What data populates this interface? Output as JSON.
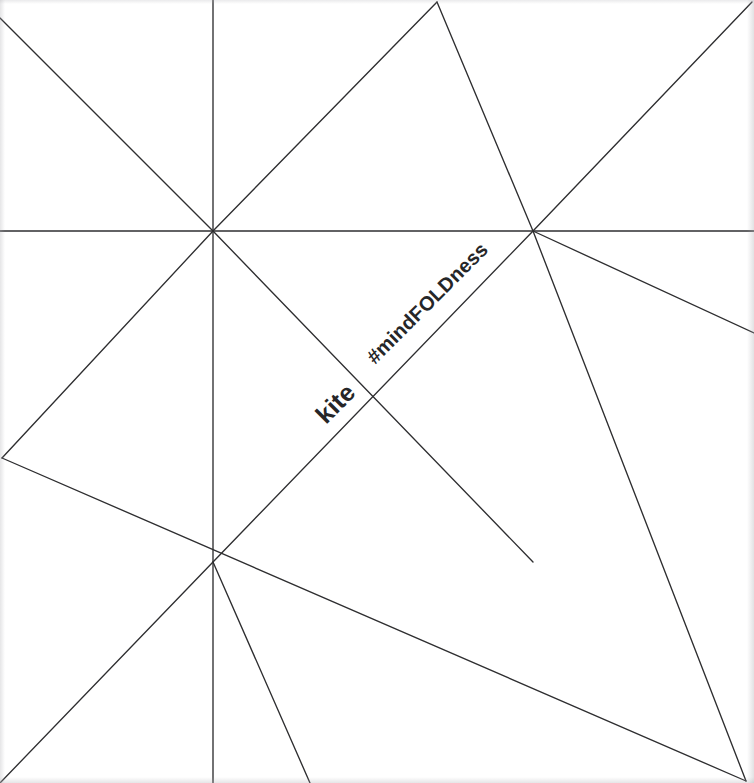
{
  "document": {
    "kind": "origami-crease-pattern",
    "model_name": "kite",
    "width": 754,
    "height": 783,
    "background_color": "#ffffff",
    "line_color": "#2e2e30",
    "text_color": "#262628"
  },
  "labels": {
    "model": "kite",
    "hashtag": "#mindFOLDness"
  },
  "chart_data": {
    "type": "diagram",
    "title": "kite",
    "annotations": [
      "kite",
      "#mindFOLDness"
    ],
    "vertices": [
      {
        "name": "center-star",
        "x": 213,
        "y": 231,
        "degree": 8
      },
      {
        "name": "right-hub",
        "x": 533,
        "y": 231,
        "degree": 6
      },
      {
        "name": "lower-hub",
        "x": 213,
        "y": 562,
        "degree": 6
      },
      {
        "name": "left-edge-node",
        "x": 2,
        "y": 458,
        "degree": 2
      },
      {
        "name": "top-edge-node",
        "x": 437,
        "y": 2,
        "degree": 2
      },
      {
        "name": "corner-top-left",
        "x": 2,
        "y": 2,
        "degree": 1
      },
      {
        "name": "corner-top-right",
        "x": 752,
        "y": 2,
        "degree": 1
      },
      {
        "name": "corner-bottom-left",
        "x": 2,
        "y": 781,
        "degree": 1
      },
      {
        "name": "corner-bottom-right",
        "x": 746,
        "y": 781,
        "degree": 3
      }
    ],
    "creases": [
      {
        "id": "vertical-axis",
        "x1": 213,
        "y1": 0,
        "x2": 213,
        "y2": 783
      },
      {
        "id": "horizontal-axis",
        "x1": 0,
        "y1": 231,
        "x2": 754,
        "y2": 231
      },
      {
        "id": "star-diag-nw",
        "x1": 213,
        "y1": 231,
        "x2": 0,
        "y2": 18
      },
      {
        "id": "star-diag-ne",
        "x1": 213,
        "y1": 231,
        "x2": 437,
        "y2": 2
      },
      {
        "id": "star-diag-sw",
        "x1": 213,
        "y1": 231,
        "x2": 2,
        "y2": 458
      },
      {
        "id": "star-diag-se",
        "x1": 213,
        "y1": 231,
        "x2": 533,
        "y2": 562
      },
      {
        "id": "top-node-to-right-hub",
        "x1": 437,
        "y1": 2,
        "x2": 533,
        "y2": 231
      },
      {
        "id": "right-hub-to-lower-hub",
        "x1": 533,
        "y1": 231,
        "x2": 213,
        "y2": 562
      },
      {
        "id": "right-hub-to-right-edge",
        "x1": 533,
        "y1": 231,
        "x2": 754,
        "y2": 333
      },
      {
        "id": "right-hub-to-corner-br",
        "x1": 533,
        "y1": 231,
        "x2": 746,
        "y2": 781
      },
      {
        "id": "left-node-to-corner-br",
        "x1": 2,
        "y1": 458,
        "x2": 746,
        "y2": 781
      },
      {
        "id": "lower-hub-to-corner-bl",
        "x1": 213,
        "y1": 562,
        "x2": 0,
        "y2": 783
      },
      {
        "id": "lower-hub-to-bottom",
        "x1": 213,
        "y1": 562,
        "x2": 310,
        "y2": 783
      },
      {
        "id": "corner-tr-diagonal",
        "x1": 752,
        "y1": 2,
        "x2": 533,
        "y2": 231
      }
    ],
    "grid": false,
    "legend": null
  }
}
